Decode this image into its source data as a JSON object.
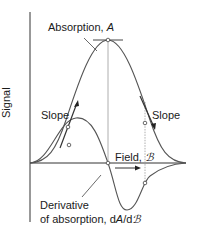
{
  "diagram": {
    "type": "epr-absorption-and-derivative",
    "y_axis_label": "Signal",
    "x_axis_label": {
      "prefix": "Field, ",
      "symbol": "ℬ"
    },
    "absorption_label": {
      "prefix": "Absorption, ",
      "symbol": "A"
    },
    "derivative_label": {
      "line1": "Derivative",
      "line2_prefix": "of absorption, d",
      "line2_symbol": "A",
      "line2_mid": "/d",
      "line2_field": "ℬ"
    },
    "slope_left": "Slope",
    "slope_right": "Slope",
    "colors": {
      "curve": "#555555",
      "axis": "#333333",
      "guide": "#999999",
      "text": "#1a1a1a"
    }
  }
}
